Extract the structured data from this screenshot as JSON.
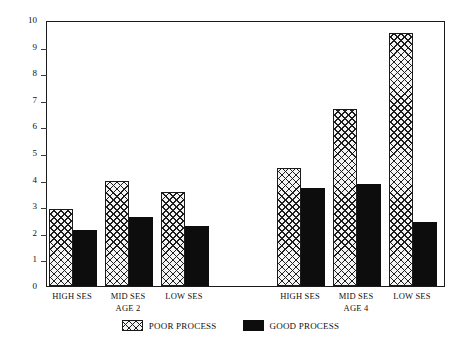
{
  "chart_data": {
    "type": "bar",
    "title": "",
    "xlabel": "",
    "ylabel": "Average Number of Problem Behaviors",
    "ylim": [
      0,
      10
    ],
    "ytick_labels": [
      "0",
      "1",
      "2",
      "3",
      "4",
      "5",
      "6",
      "7",
      "8",
      "9",
      "10"
    ],
    "ytick_values": [
      0,
      1,
      2,
      3,
      4,
      5,
      6,
      7,
      8,
      9,
      10
    ],
    "grid": false,
    "legend_position": "bottom-center",
    "groups": [
      {
        "age_label": "AGE 2",
        "categories": [
          "HIGH SES",
          "MID SES",
          "LOW SES"
        ]
      },
      {
        "age_label": "AGE 4",
        "categories": [
          "HIGH SES",
          "MID SES",
          "LOW SES"
        ]
      }
    ],
    "categories": [
      "HIGH SES (AGE 2)",
      "MID SES (AGE 2)",
      "LOW SES (AGE 2)",
      "HIGH SES (AGE 4)",
      "MID SES (AGE 4)",
      "LOW SES (AGE 4)"
    ],
    "series": [
      {
        "name": "POOR PROCESS",
        "fill": "cross-hatch",
        "color": "#f4f4f4",
        "values": [
          2.9,
          3.95,
          3.55,
          4.45,
          6.65,
          9.5
        ]
      },
      {
        "name": "GOOD PROCESS",
        "fill": "solid",
        "color": "#0d0d0d",
        "values": [
          2.1,
          2.6,
          2.25,
          3.7,
          3.85,
          2.4
        ]
      }
    ]
  },
  "axis": {
    "ylabel": "Average Number of Problem Behaviors"
  },
  "legend": {
    "items": [
      {
        "label": "POOR PROCESS"
      },
      {
        "label": "GOOD PROCESS"
      }
    ]
  }
}
